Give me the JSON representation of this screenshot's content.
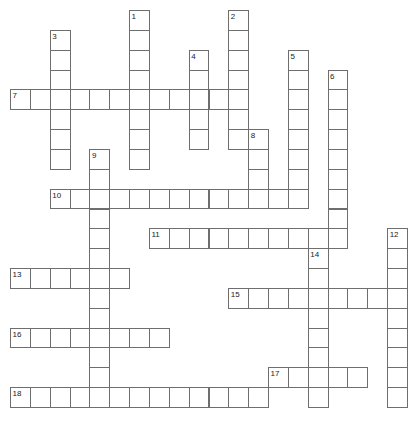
{
  "puzzle": {
    "type": "crossword-grid",
    "title": "",
    "grid": {
      "origin_x": 10,
      "origin_y": 10,
      "cell_size": 19.85,
      "columns": 20,
      "rows": 21,
      "cell_fill": "#ffffff",
      "cell_border": "#6e6e6e",
      "number_color": "#1a1a1a",
      "background": "#ffffff"
    },
    "entries": [
      {
        "number": "1",
        "direction": "down",
        "row": 0,
        "col": 6,
        "length": 8
      },
      {
        "number": "2",
        "direction": "down",
        "row": 0,
        "col": 11,
        "length": 7
      },
      {
        "number": "3",
        "direction": "down",
        "row": 1,
        "col": 2,
        "length": 7
      },
      {
        "number": "4",
        "direction": "down",
        "row": 2,
        "col": 9,
        "length": 5
      },
      {
        "number": "5",
        "direction": "down",
        "row": 2,
        "col": 14,
        "length": 8
      },
      {
        "number": "6",
        "direction": "down",
        "row": 3,
        "col": 16,
        "length": 8
      },
      {
        "number": "7",
        "direction": "across",
        "row": 4,
        "col": 0,
        "length": 12
      },
      {
        "number": "8",
        "direction": "down",
        "row": 6,
        "col": 12,
        "length": 4
      },
      {
        "number": "9",
        "direction": "down",
        "row": 7,
        "col": 4,
        "length": 13
      },
      {
        "number": "10",
        "direction": "across",
        "row": 9,
        "col": 2,
        "length": 13
      },
      {
        "number": "11",
        "direction": "across",
        "row": 11,
        "col": 7,
        "length": 10
      },
      {
        "number": "12",
        "direction": "down",
        "row": 11,
        "col": 19,
        "length": 9
      },
      {
        "number": "13",
        "direction": "across",
        "row": 13,
        "col": 0,
        "length": 6
      },
      {
        "number": "14",
        "direction": "down",
        "row": 12,
        "col": 15,
        "length": 8
      },
      {
        "number": "15",
        "direction": "across",
        "row": 14,
        "col": 11,
        "length": 9
      },
      {
        "number": "16",
        "direction": "across",
        "row": 16,
        "col": 0,
        "length": 8
      },
      {
        "number": "17",
        "direction": "across",
        "row": 18,
        "col": 13,
        "length": 5
      },
      {
        "number": "18",
        "direction": "across",
        "row": 19,
        "col": 0,
        "length": 13
      }
    ]
  }
}
